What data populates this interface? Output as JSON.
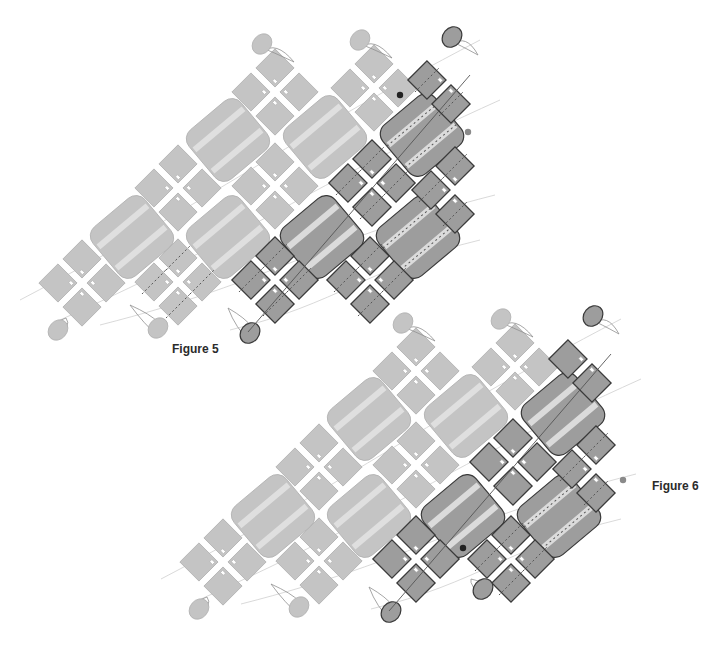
{
  "figures": [
    {
      "id": "figure-5",
      "caption": "Figure 5",
      "clusters": [
        {
          "row": 0,
          "col": 2,
          "shade": "light"
        },
        {
          "row": 0,
          "col": 3,
          "shade": "light"
        },
        {
          "row": 1,
          "col": 1,
          "shade": "light"
        },
        {
          "row": 1,
          "col": 2,
          "shade": "light"
        },
        {
          "row": 1,
          "col": 3,
          "shade": "dark",
          "thread": true
        },
        {
          "row": 2,
          "col": 0,
          "shade": "light"
        },
        {
          "row": 2,
          "col": 1,
          "shade": "light",
          "thread": true
        },
        {
          "row": 2,
          "col": 2,
          "shade": "dark",
          "thread": true
        },
        {
          "row": 2,
          "col": 3,
          "shade": "dark",
          "thread": true
        }
      ],
      "partials": [
        {
          "row": 0,
          "col": 4,
          "shade": "dark",
          "squares": [
            "left",
            "bottom"
          ],
          "thread": true
        },
        {
          "row": 1,
          "col": 4,
          "shade": "dark",
          "squares": [
            "top",
            "left",
            "bottom"
          ],
          "thread": true
        }
      ],
      "tiles": [
        {
          "row": 0,
          "col": 0,
          "shade": "light"
        },
        {
          "row": 0,
          "col": 1,
          "shade": "light"
        },
        {
          "row": 0,
          "col": 2,
          "shade": "dark",
          "thread": true
        },
        {
          "row": 1,
          "col": 0,
          "shade": "light"
        },
        {
          "row": 1,
          "col": 1,
          "shade": "light"
        },
        {
          "row": 1,
          "col": 2,
          "shade": "dark"
        },
        {
          "row": 1,
          "col": 3,
          "shade": "dark",
          "thread": true
        }
      ],
      "drops": [
        {
          "anchor": "top",
          "col": 2,
          "shade": "light"
        },
        {
          "anchor": "top",
          "col": 3,
          "shade": "light"
        },
        {
          "anchor": "top",
          "col": 4,
          "shade": "dark"
        },
        {
          "anchor": "bottom",
          "col": 0,
          "shade": "light"
        },
        {
          "anchor": "bottom",
          "col": 1,
          "shade": "light"
        },
        {
          "anchor": "bottom",
          "col": 2,
          "shade": "dark"
        }
      ],
      "markers": [
        {
          "kind": "start-dot",
          "color": "#222222"
        },
        {
          "kind": "end-dot",
          "color": "#8a8a8a"
        }
      ]
    },
    {
      "id": "figure-6",
      "caption": "Figure 6",
      "clusters": [
        {
          "row": 0,
          "col": 2,
          "shade": "light"
        },
        {
          "row": 0,
          "col": 3,
          "shade": "light"
        },
        {
          "row": 1,
          "col": 1,
          "shade": "light"
        },
        {
          "row": 1,
          "col": 2,
          "shade": "light"
        },
        {
          "row": 1,
          "col": 3,
          "shade": "dark"
        },
        {
          "row": 2,
          "col": 0,
          "shade": "light"
        },
        {
          "row": 2,
          "col": 1,
          "shade": "light"
        },
        {
          "row": 2,
          "col": 2,
          "shade": "dark"
        },
        {
          "row": 2,
          "col": 3,
          "shade": "dark",
          "thread": true
        }
      ],
      "partials": [
        {
          "row": 0,
          "col": 4,
          "shade": "dark",
          "squares": [
            "left",
            "bottom"
          ],
          "thread": false
        },
        {
          "row": 1,
          "col": 4,
          "shade": "dark",
          "squares": [
            "top",
            "left",
            "bottom"
          ],
          "thread": true
        }
      ],
      "tiles": [
        {
          "row": 0,
          "col": 0,
          "shade": "light"
        },
        {
          "row": 0,
          "col": 1,
          "shade": "light"
        },
        {
          "row": 0,
          "col": 2,
          "shade": "dark"
        },
        {
          "row": 1,
          "col": 0,
          "shade": "light"
        },
        {
          "row": 1,
          "col": 1,
          "shade": "light"
        },
        {
          "row": 1,
          "col": 2,
          "shade": "dark"
        },
        {
          "row": 1,
          "col": 3,
          "shade": "dark",
          "thread": true
        }
      ],
      "drops": [
        {
          "anchor": "top",
          "col": 2,
          "shade": "light"
        },
        {
          "anchor": "top",
          "col": 3,
          "shade": "light"
        },
        {
          "anchor": "top",
          "col": 4,
          "shade": "dark"
        },
        {
          "anchor": "bottom",
          "col": 0,
          "shade": "light"
        },
        {
          "anchor": "bottom",
          "col": 1,
          "shade": "light"
        },
        {
          "anchor": "bottom",
          "col": 2,
          "shade": "dark"
        },
        {
          "anchor": "bottom",
          "col": 3,
          "shade": "dark"
        }
      ],
      "markers": [
        {
          "kind": "start-dot",
          "color": "#222222"
        },
        {
          "kind": "end-dot",
          "color": "#8a8a8a"
        }
      ]
    }
  ],
  "colors": {
    "light_fill": "#c4c4c4",
    "light_stroke": "#b0b0b0",
    "dark_fill": "#9d9d9d",
    "dark_stroke": "#3a3a3a",
    "stripe": "#e2e2e2",
    "thread": "#8f8f8f",
    "thread_dark": "#555555",
    "caption": "#2b2b2b"
  }
}
